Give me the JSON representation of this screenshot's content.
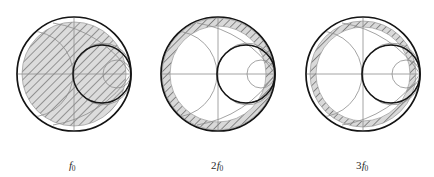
{
  "figure": {
    "kind": "smith-chart-triptych",
    "background_color": "#ffffff",
    "outer_stroke_color": "#1a1a1a",
    "grid_stroke_color": "#8a8a8a",
    "hatch_color": "#5a5a5a",
    "hatch_fill_color": "#d9d9d9",
    "inner_circle_stroke_color": "#1a1a1a"
  },
  "charts": [
    {
      "id": "chart-f0",
      "caption_multiplier": "",
      "caption_symbol": "f",
      "caption_subscript": "0",
      "caption_text": "f0",
      "center_x": 74,
      "center_y": 74,
      "outer_radius": 57,
      "region_type": "disc",
      "region_outer_radius": 52,
      "region_inner_radius": 0,
      "unit_circle_center_x": 102,
      "unit_circle_center_y": 74,
      "unit_circle_radius": 29
    },
    {
      "id": "chart-2f0",
      "caption_multiplier": "2",
      "caption_symbol": "f",
      "caption_subscript": "0",
      "caption_text": "2f0",
      "center_x": 218,
      "center_y": 74,
      "outer_radius": 57,
      "region_type": "annulus",
      "region_outer_radius": 56,
      "region_inner_radius": 48,
      "unit_circle_center_x": 246,
      "unit_circle_center_y": 74,
      "unit_circle_radius": 29
    },
    {
      "id": "chart-3f0",
      "caption_multiplier": "3",
      "caption_symbol": "f",
      "caption_subscript": "0",
      "caption_text": "3f0",
      "center_x": 363,
      "center_y": 74,
      "outer_radius": 57,
      "region_type": "annulus",
      "region_outer_radius": 53,
      "region_inner_radius": 47,
      "unit_circle_center_x": 391,
      "unit_circle_center_y": 74,
      "unit_circle_radius": 29
    }
  ],
  "grid": {
    "resistance_circles": [
      0.3,
      1.0,
      3.0
    ],
    "reactance_arcs": [
      0.5,
      1.0,
      2.0
    ],
    "real_axis": true
  }
}
